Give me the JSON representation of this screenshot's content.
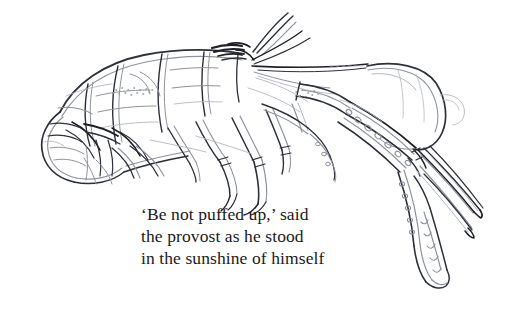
{
  "image": {
    "kind": "pencil-sketch-illustration",
    "subject": "lobster",
    "background_color": "#ffffff",
    "ink_color": "#4a4e58",
    "ink_color_dark": "#1e2026",
    "ink_color_light": "#b3b7c0"
  },
  "caption": {
    "text_color": "#1a1a1a",
    "lines": [
      "‘Be not puffed up,’ said",
      "the provost as he stood",
      "in the sunshine of himself"
    ]
  }
}
